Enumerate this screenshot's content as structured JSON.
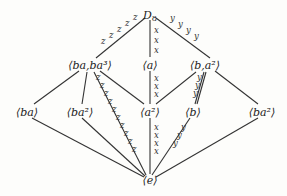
{
  "diagram": {
    "type": "subgroup-lattice",
    "nodes": [
      {
        "id": "D8",
        "label": "D",
        "sub": "8",
        "x": 150,
        "y": 15
      },
      {
        "id": "ba_ba3",
        "label": "⟨ba,ba³⟩",
        "x": 90,
        "y": 65
      },
      {
        "id": "a",
        "label": "⟨a⟩",
        "x": 150,
        "y": 65
      },
      {
        "id": "b_a2",
        "label": "⟨b,a²⟩",
        "x": 205,
        "y": 65
      },
      {
        "id": "ba",
        "label": "⟨ba⟩",
        "x": 27,
        "y": 112
      },
      {
        "id": "ba2_left",
        "label": "⟨ba²⟩",
        "x": 80,
        "y": 112
      },
      {
        "id": "a2",
        "label": "⟨a²⟩",
        "x": 150,
        "y": 112
      },
      {
        "id": "b",
        "label": "⟨b⟩",
        "x": 193,
        "y": 112
      },
      {
        "id": "ba2_right",
        "label": "⟨ba²⟩",
        "x": 262,
        "y": 112
      },
      {
        "id": "e",
        "label": "⟨e⟩",
        "x": 150,
        "y": 180
      }
    ],
    "edges": [
      {
        "from": [
          145,
          18
        ],
        "to": [
          96,
          58
        ]
      },
      {
        "from": [
          150,
          20
        ],
        "to": [
          150,
          57
        ]
      },
      {
        "from": [
          156,
          18
        ],
        "to": [
          210,
          58
        ]
      },
      {
        "from": [
          79,
          71
        ],
        "to": [
          34,
          104
        ]
      },
      {
        "from": [
          87,
          72
        ],
        "to": [
          82,
          104
        ]
      },
      {
        "from": [
          94,
          72
        ],
        "to": [
          146,
          175
        ]
      },
      {
        "from": [
          100,
          71
        ],
        "to": [
          144,
          104
        ]
      },
      {
        "from": [
          150,
          71
        ],
        "to": [
          150,
          104
        ]
      },
      {
        "from": [
          196,
          72
        ],
        "to": [
          156,
          104
        ]
      },
      {
        "from": [
          204,
          72
        ],
        "to": [
          195,
          104
        ]
      },
      {
        "from": [
          206,
          72
        ],
        "to": [
          197,
          104
        ]
      },
      {
        "from": [
          215,
          71
        ],
        "to": [
          258,
          104
        ]
      },
      {
        "from": [
          32,
          118
        ],
        "to": [
          144,
          177
        ]
      },
      {
        "from": [
          82,
          118
        ],
        "to": [
          145,
          176
        ]
      },
      {
        "from": [
          150,
          118
        ],
        "to": [
          150,
          174
        ]
      },
      {
        "from": [
          190,
          118
        ],
        "to": [
          152,
          175
        ]
      },
      {
        "from": [
          258,
          118
        ],
        "to": [
          156,
          177
        ]
      }
    ],
    "edge_labels": [
      {
        "text": "z",
        "x": 133,
        "y": 20
      },
      {
        "text": "z",
        "x": 125,
        "y": 26
      },
      {
        "text": "z",
        "x": 117,
        "y": 32
      },
      {
        "text": "z",
        "x": 109,
        "y": 38
      },
      {
        "text": "z",
        "x": 101,
        "y": 44
      },
      {
        "text": "x",
        "x": 154,
        "y": 33
      },
      {
        "text": "x",
        "x": 154,
        "y": 43
      },
      {
        "text": "x",
        "x": 154,
        "y": 53
      },
      {
        "text": "y",
        "x": 170,
        "y": 21
      },
      {
        "text": "y",
        "x": 178,
        "y": 27
      },
      {
        "text": "y",
        "x": 186,
        "y": 33
      },
      {
        "text": "y",
        "x": 194,
        "y": 39
      },
      {
        "text": "x",
        "x": 154,
        "y": 81
      },
      {
        "text": "x",
        "x": 154,
        "y": 89
      },
      {
        "text": "x",
        "x": 154,
        "y": 97
      },
      {
        "text": "y",
        "x": 197,
        "y": 80
      },
      {
        "text": "y",
        "x": 195,
        "y": 88
      },
      {
        "text": "y",
        "x": 193,
        "y": 96
      },
      {
        "text": "z",
        "x": 96,
        "y": 80
      },
      {
        "text": "z",
        "x": 100,
        "y": 88
      },
      {
        "text": "z",
        "x": 104,
        "y": 96
      },
      {
        "text": "z",
        "x": 108,
        "y": 104
      },
      {
        "text": "z",
        "x": 112,
        "y": 112
      },
      {
        "text": "z",
        "x": 116,
        "y": 120
      },
      {
        "text": "z",
        "x": 120,
        "y": 128
      },
      {
        "text": "z",
        "x": 124,
        "y": 136
      },
      {
        "text": "z",
        "x": 128,
        "y": 144
      },
      {
        "text": "z",
        "x": 132,
        "y": 152
      },
      {
        "text": "x",
        "x": 154,
        "y": 130
      },
      {
        "text": "x",
        "x": 154,
        "y": 138
      },
      {
        "text": "x",
        "x": 154,
        "y": 146
      },
      {
        "text": "x",
        "x": 154,
        "y": 154
      },
      {
        "text": "y",
        "x": 181,
        "y": 130
      },
      {
        "text": "y",
        "x": 177,
        "y": 138
      },
      {
        "text": "y",
        "x": 173,
        "y": 146
      }
    ]
  }
}
